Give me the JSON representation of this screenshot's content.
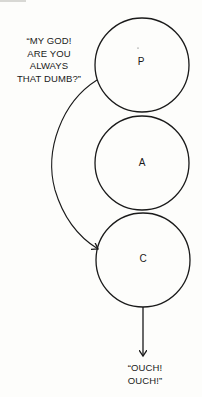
{
  "diagram": {
    "type": "transactional-analysis-ego-states",
    "nodes": [
      {
        "id": "P",
        "label": "P",
        "cx": 142,
        "cy": 65,
        "r": 47
      },
      {
        "id": "A",
        "label": "A",
        "cx": 142,
        "cy": 163,
        "r": 47
      },
      {
        "id": "C",
        "label": "C",
        "cx": 143,
        "cy": 260,
        "r": 47
      }
    ],
    "edges": [
      {
        "from": "external",
        "to": "C",
        "kind": "curved-arrow",
        "label_ref": "incoming_quote"
      },
      {
        "from": "C",
        "to": "external",
        "kind": "straight-arrow",
        "label_ref": "outgoing_quote"
      }
    ],
    "incoming_quote": {
      "lines": [
        "“MY GOD!",
        "ARE YOU",
        "ALWAYS",
        "THAT DUMB?”"
      ]
    },
    "outgoing_quote": {
      "lines": [
        "“OUCH!",
        "OUCH!”"
      ]
    },
    "colors": {
      "stroke": "#1a1a1a",
      "background": "#fdfdfb"
    }
  }
}
